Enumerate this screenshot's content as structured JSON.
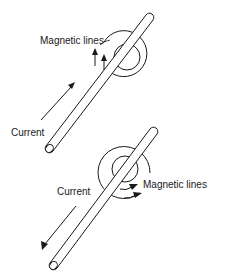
{
  "figure": {
    "stroke_color": "#1a1a1a",
    "background_color": "#ffffff"
  },
  "panels": [
    {
      "id": "upward-current",
      "current_label": "Current",
      "field_label": "Magnetic lines",
      "current_direction": "up-right",
      "field_direction": "counterclockwise"
    },
    {
      "id": "downward-current",
      "current_label": "Current",
      "field_label": "Magnetic lines",
      "current_direction": "down-left",
      "field_direction": "clockwise"
    }
  ]
}
